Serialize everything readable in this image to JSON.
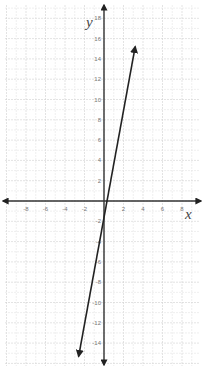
{
  "chart_data": {
    "type": "line",
    "title": "",
    "xlabel": "x",
    "ylabel": "y",
    "xlim": [
      -10,
      10
    ],
    "ylim": [
      -16,
      19
    ],
    "grid": true,
    "x_ticks": [
      -8,
      -6,
      -4,
      -2,
      2,
      4,
      6,
      8
    ],
    "y_ticks": [
      18,
      16,
      14,
      12,
      10,
      8,
      6,
      4,
      2,
      -2,
      -4,
      -6,
      -8,
      -10,
      -12,
      -14
    ],
    "series": [
      {
        "name": "line",
        "points": [
          [
            -2.6,
            -15.3
          ],
          [
            3.2,
            15.2
          ]
        ],
        "arrows": "both"
      }
    ],
    "colors": {
      "line": "#222222",
      "axis": "#333333",
      "grid_minor": "#e4e4e4",
      "grid_major": "#d0d0d0",
      "tick_text": "#777777"
    }
  }
}
